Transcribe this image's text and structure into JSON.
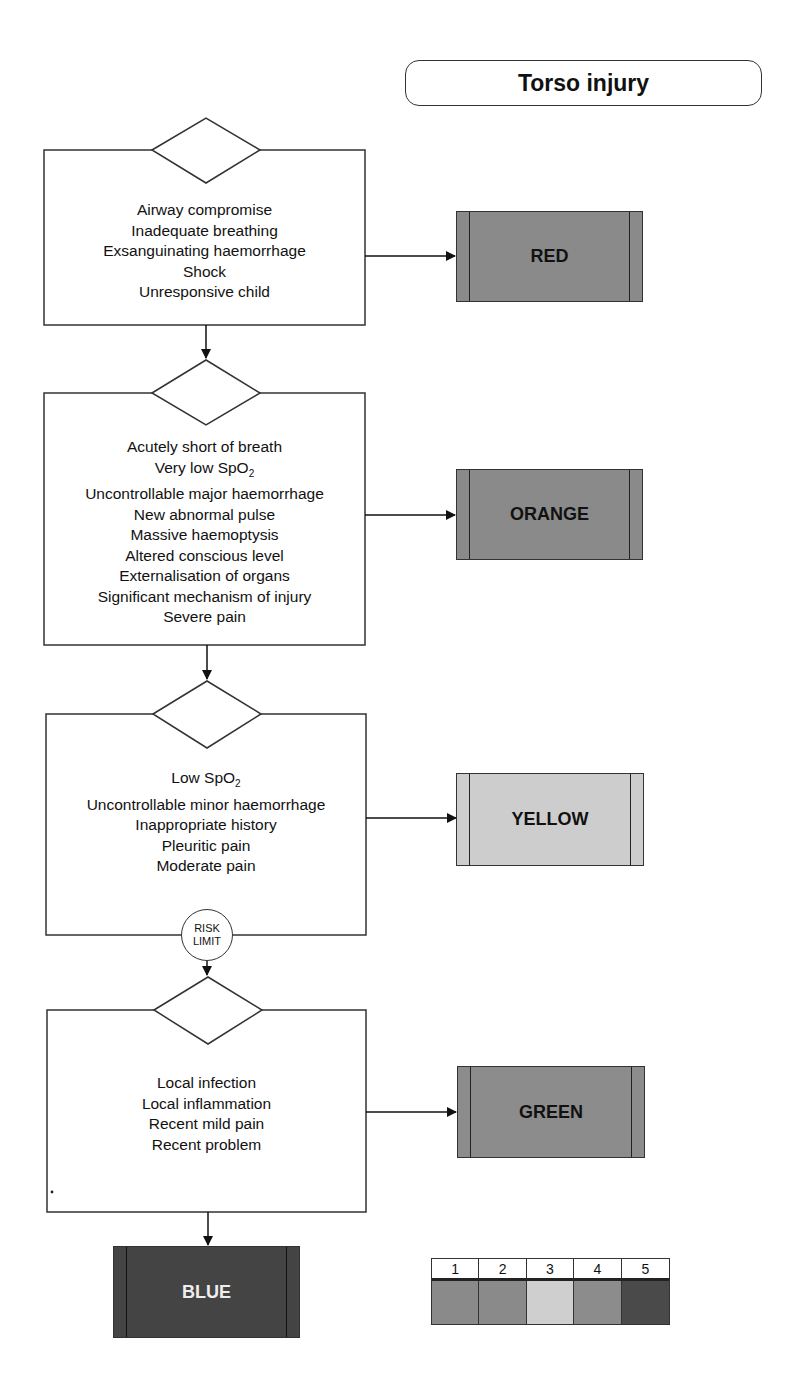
{
  "title": "Torso injury",
  "steps": [
    {
      "criteria": [
        "Airway compromise",
        "Inadequate breathing",
        "Exsanguinating haemorrhage",
        "Shock",
        "Unresponsive child"
      ],
      "outcome": "RED"
    },
    {
      "criteria": [
        "Acutely short of breath",
        "Very low SpO",
        "Uncontrollable major haemorrhage",
        "New abnormal pulse",
        "Massive haemoptysis",
        "Altered conscious level",
        "Externalisation of organs",
        "Significant mechanism of injury",
        "Severe pain"
      ],
      "spo2_subscript": "2",
      "outcome": "ORANGE"
    },
    {
      "criteria": [
        "Low SpO",
        "Uncontrollable minor haemorrhage",
        "Inappropriate history",
        "Pleuritic pain",
        "Moderate pain"
      ],
      "spo2_subscript": "2",
      "outcome": "YELLOW"
    },
    {
      "criteria": [
        "Local infection",
        "Local inflammation",
        "Recent mild pain",
        "Recent problem"
      ],
      "outcome": "GREEN"
    }
  ],
  "risk_limit": {
    "line1": "RISK",
    "line2": "LIMIT"
  },
  "default_outcome": "BLUE",
  "legend": {
    "numbers": [
      "1",
      "2",
      "3",
      "4",
      "5"
    ],
    "colors": [
      "#8a8a8a",
      "#8a8a8a",
      "#cfcfcf",
      "#8c8c8c",
      "#4a4a4a"
    ]
  },
  "colors": {
    "red_box": "#8a8a8a",
    "orange_box": "#8a8a8a",
    "yellow_box": "#cdcdcd",
    "green_box": "#8c8c8c",
    "blue_box": "#444444",
    "blue_text": "#eeeeee"
  }
}
